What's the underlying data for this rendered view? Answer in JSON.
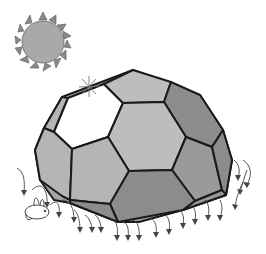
{
  "illustration": {
    "description": "Half soccer-ball shaped dome (truncated icosahedron) with sun above and rain/drip arrows around base",
    "colors": {
      "background": "#ffffff",
      "outline": "#1a1a1a",
      "light_face": "#bdbdbd",
      "mid_face": "#a6a6a6",
      "dark_face": "#8c8c8c",
      "open_face": "#ffffff",
      "sun_body": "#a9a9a9",
      "sun_rays": "#8a8a8a",
      "arrows": "#444444"
    },
    "elements": {
      "sun": "sun-icon",
      "sparkle": "sparkle-icon",
      "dome": "dome-structure",
      "arrows": "drip-arrows",
      "animal": "small-animal"
    }
  }
}
